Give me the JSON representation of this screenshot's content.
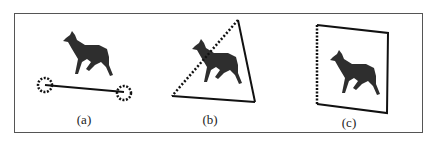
{
  "figure": {
    "panels": [
      {
        "id": "a",
        "label": "(a)",
        "description": "deer silhouette with segment connecting two dotted circles"
      },
      {
        "id": "b",
        "label": "(b)",
        "description": "deer silhouette inside triangle with one dotted edge"
      },
      {
        "id": "c",
        "label": "(c)",
        "description": "deer silhouette inside quadrilateral with dotted left edge"
      }
    ],
    "colors": {
      "stroke": "#111111",
      "silhouette": "#2e2e2e",
      "frame": "#555555"
    }
  }
}
